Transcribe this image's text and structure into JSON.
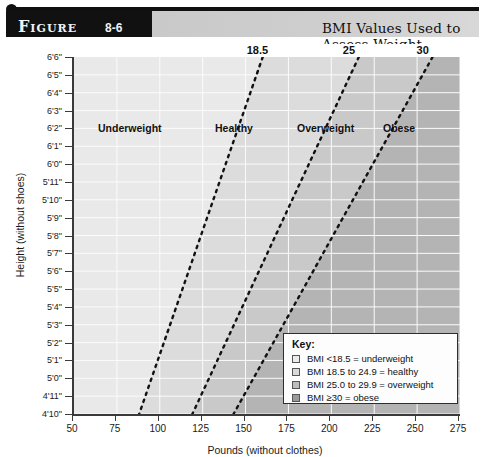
{
  "header": {
    "figure_word": "Figure",
    "figure_number": "8-6",
    "title": "BMI Values Used to Assess Weight"
  },
  "chart_data": {
    "type": "line",
    "title": "BMI Values Used to Assess Weight",
    "xlabel": "Pounds (without clothes)",
    "ylabel": "Height (without shoes)",
    "xlim": [
      50,
      275
    ],
    "xticks": [
      "50",
      "75",
      "100",
      "125",
      "150",
      "175",
      "200",
      "225",
      "250",
      "275"
    ],
    "yticks": [
      "6'6\"",
      "6'5\"",
      "6'4\"",
      "6'3\"",
      "6'2\"",
      "6'1\"",
      "6'0\"",
      "5'11\"",
      "5'10\"",
      "5'9\"",
      "5'8\"",
      "5'7\"",
      "5'6\"",
      "5'5\"",
      "5'4\"",
      "5'3\"",
      "5'2\"",
      "5'1\"",
      "5'0\"",
      "4'11\"",
      "4'10\""
    ],
    "grid": true,
    "legend_position": "inside-bottom-right",
    "threshold_labels": [
      "18.5",
      "25",
      "30"
    ],
    "zone_labels": [
      "Underweight",
      "Healthy",
      "Overweight",
      "Obese"
    ],
    "series": [
      {
        "name": "BMI 18.5",
        "bmi": 18.5,
        "lbs_at_4ft10in": 88,
        "lbs_at_6ft6in": 160
      },
      {
        "name": "BMI 25",
        "bmi": 25,
        "lbs_at_4ft10in": 119,
        "lbs_at_6ft6in": 216
      },
      {
        "name": "BMI 30",
        "bmi": 30,
        "lbs_at_4ft10in": 143,
        "lbs_at_6ft6in": 259
      }
    ],
    "band_colors": [
      "#e9e9e9",
      "#dcdcdc",
      "#c9c9c9",
      "#b4b4b4"
    ]
  },
  "key": {
    "title": "Key:",
    "items": [
      {
        "label": "BMI <18.5 = underweight",
        "color": "#ececec"
      },
      {
        "label": "BMI 18.5 to 24.9 = healthy",
        "color": "#d8d8d8"
      },
      {
        "label": "BMI 25.0 to 29.9 = overweight",
        "color": "#bdbdbd"
      },
      {
        "label": "BMI ≥30 = obese",
        "color": "#9a9a9a"
      }
    ]
  }
}
